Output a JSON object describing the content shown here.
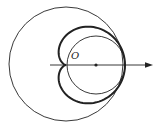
{
  "diagram": {
    "type": "polar-cardioid",
    "labels": {
      "origin": "O"
    },
    "elements": [
      "outer circle centered at origin",
      "inner circle tangent at origin",
      "cardioid with cusp at origin",
      "polar axis arrow",
      "center point of inner circle"
    ],
    "colors": {
      "stroke": "#222222",
      "background": "#ffffff"
    }
  }
}
